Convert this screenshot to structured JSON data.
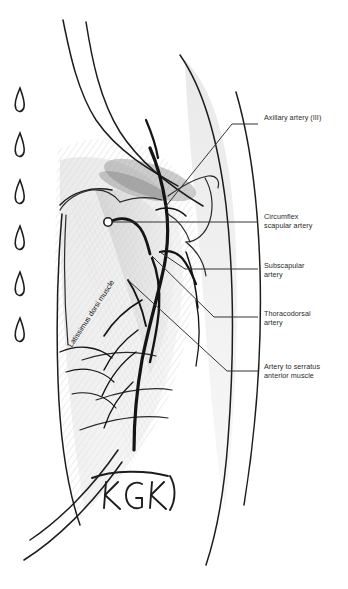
{
  "figure": {
    "medium": "pencil sketch",
    "background_color": "#ffffff",
    "ink_color": "#1d1d1d",
    "label_color": "#2b2b2b",
    "leader_color": "#333333",
    "shade_color": "#b9b9b9"
  },
  "labels": [
    {
      "id": "axillary-artery",
      "text": "Axillary artery (III)",
      "x": 264,
      "y": 113
    },
    {
      "id": "circumflex-scapular",
      "text": "Circumflex\nscapular artery",
      "x": 264,
      "y": 212
    },
    {
      "id": "subscapular-artery",
      "text": "Subscapular\nartery",
      "x": 264,
      "y": 261
    },
    {
      "id": "thoracodorsal-artery",
      "text": "Thoracodorsal\nartery",
      "x": 264,
      "y": 309
    },
    {
      "id": "artery-serratus",
      "text": "Artery to serratus\nanterior muscle",
      "x": 264,
      "y": 362
    }
  ],
  "muscle_label": {
    "id": "latissimus-dorsi",
    "text": "Latissimus dorsi muscle",
    "rotation_deg": -57
  },
  "signature": {
    "text": "KGK",
    "x": 100,
    "y": 478
  },
  "margin_marks": {
    "name": "rib-tick-marks",
    "count": 6,
    "y_positions": [
      96,
      141,
      188,
      234,
      280,
      326
    ],
    "x": 18
  },
  "leaders": [
    {
      "id": "leader-axillary",
      "points": "166,206 232,124 258,124",
      "end_marker": "none"
    },
    {
      "id": "leader-circumflex",
      "points": "108,222 258,222",
      "end_marker": "circle"
    },
    {
      "id": "leader-subscapular",
      "points": "160,252 185,269 258,269",
      "end_marker": "none"
    },
    {
      "id": "leader-thoracodorsal",
      "points": "152,256 214,317 258,317",
      "end_marker": "none"
    },
    {
      "id": "leader-serratus",
      "points": "128,280 227,371 258,371",
      "end_marker": "none"
    }
  ]
}
